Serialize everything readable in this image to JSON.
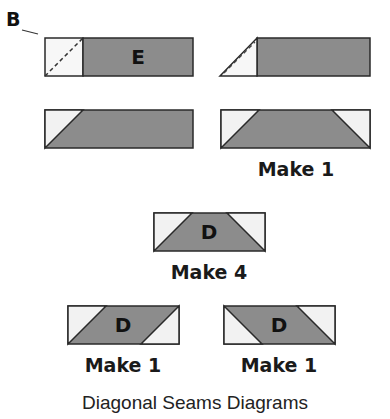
{
  "colors": {
    "dark": "#8c8c8c",
    "light": "#f2f2f2",
    "stroke": "#2a2a2a"
  },
  "labels": {
    "piece_b": "B",
    "piece_e": "E",
    "piece_d": "D"
  },
  "diagrams": [
    {
      "id": "step1-left",
      "caption": ""
    },
    {
      "id": "step1-right",
      "caption": ""
    },
    {
      "id": "step2-left",
      "caption": ""
    },
    {
      "id": "step2-right",
      "caption": "Make 1"
    },
    {
      "id": "d-center",
      "letter": "D",
      "caption": "Make 4"
    },
    {
      "id": "d-left",
      "letter": "D",
      "caption": "Make 1"
    },
    {
      "id": "d-right",
      "letter": "D",
      "caption": "Make 1"
    }
  ],
  "title": "Diagonal Seams Diagrams"
}
